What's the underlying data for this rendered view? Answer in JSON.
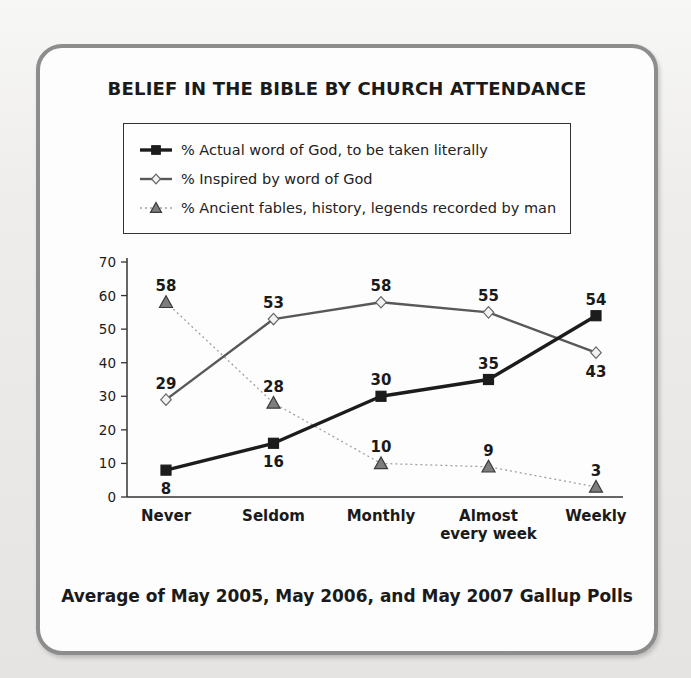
{
  "title": "BELIEF IN THE BIBLE BY CHURCH ATTENDANCE",
  "caption": "Average of May 2005, May 2006, and May 2007 Gallup Polls",
  "colors": {
    "panel_border": "#8d8d8d",
    "axis": "#333333",
    "text": "#1a1a1a"
  },
  "chart_data": {
    "type": "line",
    "title": "BELIEF IN THE BIBLE BY CHURCH ATTENDANCE",
    "xlabel": "",
    "ylabel": "",
    "categories": [
      "Never",
      "Seldom",
      "Monthly",
      "Almost every week",
      "Weekly"
    ],
    "yticks": [
      0,
      10,
      20,
      30,
      40,
      50,
      60,
      70
    ],
    "ylim": [
      0,
      70
    ],
    "grid": false,
    "legend_position": "top",
    "series": [
      {
        "name": "% Actual word of God, to be taken literally",
        "values": [
          8,
          16,
          30,
          35,
          54
        ],
        "marker": "square",
        "line_color": "#1c1c1c",
        "marker_fill": "#1c1c1c",
        "marker_stroke": "#1c1c1c",
        "line_style": "solid",
        "line_width": 3.4,
        "label_pos": [
          "below",
          "below",
          "above",
          "above",
          "above"
        ]
      },
      {
        "name": "% Inspired by word of God",
        "values": [
          29,
          53,
          58,
          55,
          43
        ],
        "marker": "diamond",
        "line_color": "#585858",
        "marker_fill": "#f2f2f2",
        "marker_stroke": "#666666",
        "line_style": "solid",
        "line_width": 2.4,
        "label_pos": [
          "above",
          "above",
          "above",
          "above",
          "below"
        ]
      },
      {
        "name": "% Ancient fables, history, legends recorded by man",
        "values": [
          58,
          28,
          10,
          9,
          3
        ],
        "marker": "triangle",
        "line_color": "#a0a0a0",
        "marker_fill": "#7d7d7d",
        "marker_stroke": "#3a3a3a",
        "line_style": "dotted",
        "line_width": 1.3,
        "label_pos": [
          "above",
          "above",
          "above",
          "above",
          "above"
        ]
      }
    ]
  }
}
